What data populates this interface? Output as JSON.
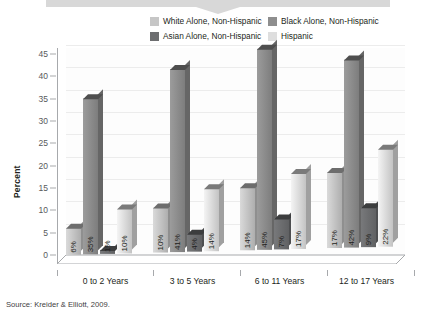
{
  "banner": {
    "present": true,
    "color": "#d8d8d8"
  },
  "legend": {
    "items": [
      {
        "label": "White Alone, Non-Hispanic",
        "color": "#c6c6c6"
      },
      {
        "label": "Black Alone, Non-Hispanic",
        "color": "#8e8e8e"
      },
      {
        "label": "Asian Alone, Non-Hispanic",
        "color": "#6d6e70"
      },
      {
        "label": "Hispanic",
        "color": "#dedede"
      }
    ]
  },
  "source": {
    "text": "Source: Kreider & Elliott, 2009."
  },
  "chart_data": {
    "type": "bar",
    "title": "",
    "xlabel": "",
    "ylabel": "Percent",
    "ylim": [
      0,
      45
    ],
    "yticks": [
      0,
      5,
      10,
      15,
      20,
      25,
      30,
      35,
      40,
      45
    ],
    "ytick_labels": [
      "0",
      "5",
      "10",
      "15",
      "20",
      "25",
      "30",
      "35",
      "40",
      "45"
    ],
    "grid": true,
    "legend_position": "top",
    "value_suffix": "%",
    "categories": [
      "0 to 2 Years",
      "3 to 5 Years",
      "6 to 11 Years",
      "12 to 17 Years"
    ],
    "series": [
      {
        "name": "White Alone, Non-Hispanic",
        "color": "#c6c6c6",
        "values": [
          6,
          10,
          14,
          17
        ],
        "labels": [
          "6%",
          "10%",
          "14%",
          "17%"
        ]
      },
      {
        "name": "Black Alone, Non-Hispanic",
        "color": "#8e8e8e",
        "values": [
          35,
          41,
          45,
          42
        ],
        "labels": [
          "35%",
          "41%",
          "45%",
          "42%"
        ]
      },
      {
        "name": "Asian Alone, Non-Hispanic",
        "color": "#6d6e70",
        "values": [
          1,
          4,
          7,
          9
        ],
        "labels": [
          "1%",
          "4%",
          "7%",
          "9%"
        ]
      },
      {
        "name": "Hispanic",
        "color": "#dedede",
        "values": [
          10,
          14,
          17,
          22
        ],
        "labels": [
          "10%",
          "14%",
          "17%",
          "22%"
        ]
      }
    ]
  }
}
